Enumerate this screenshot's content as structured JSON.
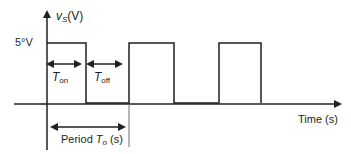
{
  "diagram": {
    "type": "pulse-waveform",
    "y_axis_label_var": "v",
    "y_axis_label_sub": "S",
    "y_axis_label_unit": "(V)",
    "level_label": "5°V",
    "x_axis_label": "Time (s)",
    "t_on_var": "T",
    "t_on_sub": "on",
    "t_off_var": "T",
    "t_off_sub": "off",
    "period_prefix": "Period ",
    "period_var": "T",
    "period_sub": "o",
    "period_unit": "(s)",
    "pulses": [
      {
        "start": 47,
        "end": 86
      },
      {
        "start": 129,
        "end": 174
      },
      {
        "start": 219,
        "end": 261
      }
    ],
    "line_color": "#231f20"
  }
}
